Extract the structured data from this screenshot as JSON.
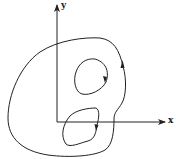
{
  "figure": {
    "axes": {
      "x_label": "x",
      "y_label": "y"
    },
    "curves": [
      {
        "name": "outer-boundary",
        "orientation": "counterclockwise",
        "arrow": "upward on right side"
      },
      {
        "name": "upper-inner-loop",
        "orientation": "clockwise",
        "arrow": "downward on right side"
      },
      {
        "name": "lower-inner-loop",
        "orientation": "clockwise",
        "arrow": "downward on right side"
      }
    ],
    "colors": {
      "stroke": "#222222",
      "background": "#ffffff"
    }
  }
}
